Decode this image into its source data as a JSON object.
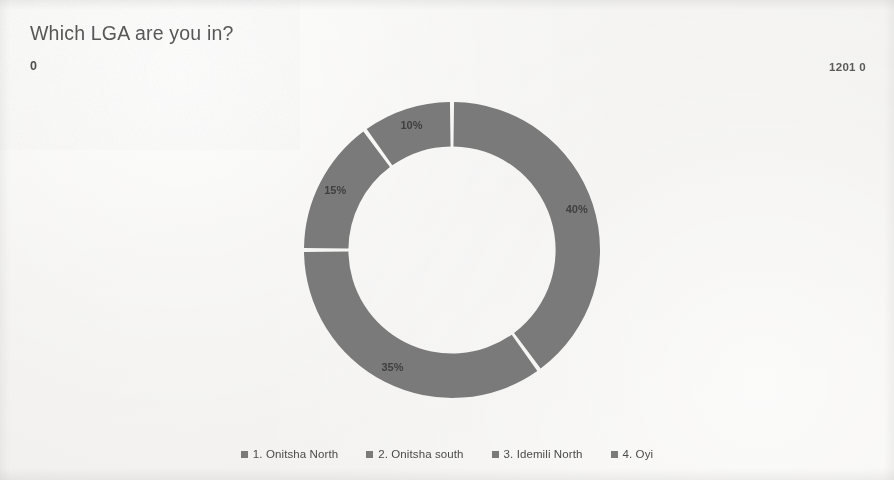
{
  "slide": {
    "title": "Which LGA are you in?",
    "axis_min_label": "0",
    "axis_max_label": "1201 0"
  },
  "legend": {
    "items": [
      {
        "label": "1. Onitsha North",
        "color": "#7a7a7a"
      },
      {
        "label": "2. Onitsha south",
        "color": "#7a7a7a"
      },
      {
        "label": "3. Idemili North",
        "color": "#7a7a7a"
      },
      {
        "label": "4. Oyi",
        "color": "#7a7a7a"
      }
    ]
  },
  "chart_data": {
    "type": "pie",
    "variant": "donut",
    "title": "Which LGA are you in?",
    "xlabel": "",
    "ylabel": "",
    "categories": [
      "1. Onitsha North",
      "2. Onitsha south",
      "3. Idemili North",
      "4. Oyi"
    ],
    "values": [
      40,
      35,
      15,
      10
    ],
    "value_unit": "%",
    "data_labels": [
      "40%",
      "35%",
      "15%",
      "10%"
    ],
    "colors": [
      "#7a7a7a",
      "#7a7a7a",
      "#7a7a7a",
      "#7a7a7a"
    ],
    "legend_position": "bottom",
    "grid": false,
    "start_angle_deg": 0,
    "direction": "clockwise",
    "inner_radius_ratio": 0.7,
    "annotations": [
      "0",
      "1201 0"
    ]
  }
}
